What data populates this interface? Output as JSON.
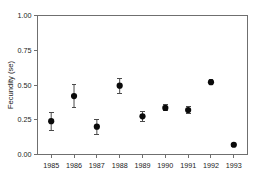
{
  "chart_data": {
    "type": "scatter",
    "title": "",
    "xlabel": "",
    "ylabel": "Fecundity (se)",
    "xlim": [
      1984.4,
      1993.6
    ],
    "ylim": [
      0.0,
      1.0
    ],
    "grid": false,
    "legend": "none",
    "x": [
      1985,
      1986,
      1987,
      1988,
      1989,
      1990,
      1991,
      1992,
      1993
    ],
    "categories": [
      "1985",
      "1986",
      "1987",
      "1988",
      "1989",
      "1990",
      "1991",
      "1992",
      "1993"
    ],
    "values": [
      0.24,
      0.42,
      0.2,
      0.495,
      0.275,
      0.335,
      0.32,
      0.52,
      0.07
    ],
    "errors": [
      0.065,
      0.085,
      0.055,
      0.055,
      0.035,
      0.022,
      0.022,
      0.018,
      0.012
    ],
    "series": [
      {
        "name": "Fecundity",
        "marker": "filled-circle",
        "color": "#0a0a0a",
        "points": [
          {
            "x": "1985",
            "y": 0.24,
            "err": 0.065,
            "low": 0.175,
            "high": 0.305
          },
          {
            "x": "1986",
            "y": 0.42,
            "err": 0.085,
            "low": 0.335,
            "high": 0.505
          },
          {
            "x": "1987",
            "y": 0.2,
            "err": 0.055,
            "low": 0.145,
            "high": 0.255
          },
          {
            "x": "1988",
            "y": 0.495,
            "err": 0.055,
            "low": 0.44,
            "high": 0.55
          },
          {
            "x": "1989",
            "y": 0.275,
            "err": 0.035,
            "low": 0.24,
            "high": 0.31
          },
          {
            "x": "1990",
            "y": 0.335,
            "err": 0.022,
            "low": 0.313,
            "high": 0.357
          },
          {
            "x": "1991",
            "y": 0.32,
            "err": 0.022,
            "low": 0.298,
            "high": 0.342
          },
          {
            "x": "1992",
            "y": 0.52,
            "err": 0.018,
            "low": 0.502,
            "high": 0.538
          },
          {
            "x": "1993",
            "y": 0.07,
            "err": 0.012,
            "low": 0.058,
            "high": 0.082
          }
        ]
      }
    ],
    "yticks": [
      0.0,
      0.25,
      0.5,
      0.75,
      1.0
    ],
    "ytick_labels": [
      "0.00",
      "0.25",
      "0.50",
      "0.75",
      "1.00"
    ],
    "xticks": [
      1985,
      1986,
      1987,
      1988,
      1989,
      1990,
      1991,
      1992,
      1993
    ],
    "xtick_labels": [
      "1985",
      "1986",
      "1987",
      "1988",
      "1989",
      "1990",
      "1991",
      "1992",
      "1993"
    ],
    "colors": {
      "marker": "#0a0a0a",
      "errorbar": "#4a4a4a",
      "axis": "#6f6f6f",
      "text": "#1a1a1a",
      "background": "#ffffff"
    }
  }
}
